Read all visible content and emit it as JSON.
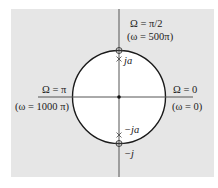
{
  "diagram": {
    "type": "z-plane unit circle",
    "colors": {
      "background": "#e6e6e6",
      "disk": "#ffffff",
      "stroke": "#1a1a1a",
      "axis": "#555555"
    },
    "labels": {
      "top_freq": "Ω = π/2",
      "top_omega": "(ω = 500π)",
      "left_freq": "Ω = π",
      "left_omega": "(ω = 1000 π)",
      "right_freq": "Ω = 0",
      "right_omega": "(ω = 0)",
      "pole_top": "ja",
      "pole_bottom": "−ja",
      "zero_bottom": "−j"
    },
    "points": [
      {
        "kind": "zero",
        "location": "j",
        "marker": "circle"
      },
      {
        "kind": "zero",
        "location": "−j",
        "marker": "circle"
      },
      {
        "kind": "pole",
        "location": "ja",
        "marker": "x"
      },
      {
        "kind": "pole",
        "location": "−ja",
        "marker": "x"
      },
      {
        "kind": "origin",
        "location": "0",
        "marker": "dot"
      }
    ]
  }
}
